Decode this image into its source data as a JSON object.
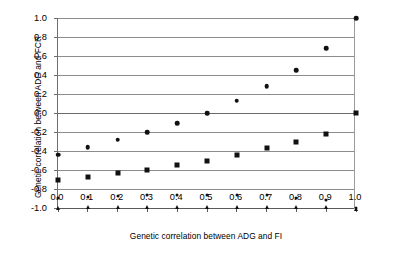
{
  "chart_data": {
    "type": "scatter",
    "title": "",
    "xlabel": "Genetic correlation between ADG and FI",
    "ylabel": "Genetic correlation between ADG and FCR",
    "xlim": [
      0.0,
      1.0
    ],
    "ylim": [
      -1.0,
      1.0
    ],
    "grid": true,
    "legend": "none",
    "xticklabels": [
      "0.0",
      "0.1",
      "0.2",
      "0.3",
      "0.4",
      "0.5",
      "0.6",
      "0.7",
      "0.8",
      "0.9",
      "1.0"
    ],
    "yticklabels": [
      "1.0",
      "0.8",
      "0.6",
      "0.4",
      "0.2",
      "0.0",
      "-0.2",
      "-0.4",
      "-0.6",
      "-0.8",
      "-1.0"
    ],
    "xticks": [
      0.0,
      0.1,
      0.2,
      0.3,
      0.4,
      0.5,
      0.6,
      0.7,
      0.8,
      0.9,
      1.0
    ],
    "yticks": [
      1.0,
      0.8,
      0.6,
      0.4,
      0.2,
      0.0,
      -0.2,
      -0.4,
      -0.6,
      -0.8,
      -1.0
    ],
    "x": [
      0.0,
      0.1,
      0.2,
      0.3,
      0.4,
      0.5,
      0.6,
      0.7,
      0.8,
      0.9,
      1.0
    ],
    "series": [
      {
        "name": "series-circle-upper",
        "marker": "circle",
        "values": [
          -0.44,
          -0.36,
          -0.28,
          -0.2,
          -0.11,
          0.0,
          0.13,
          0.28,
          0.45,
          0.68,
          1.0
        ]
      },
      {
        "name": "series-square-middle",
        "marker": "square",
        "values": [
          -0.7,
          -0.67,
          -0.63,
          -0.6,
          -0.55,
          -0.5,
          -0.44,
          -0.37,
          -0.31,
          -0.22,
          0.0
        ]
      },
      {
        "name": "series-dot-lower",
        "marker": "dot",
        "values": [
          -0.89,
          -0.88,
          -0.87,
          -0.86,
          -0.86,
          -0.86,
          -0.86,
          -0.86,
          -0.89,
          -0.92,
          -1.0
        ]
      },
      {
        "name": "series-triangle-bottom",
        "marker": "triangle",
        "values": [
          -0.99,
          -0.98,
          -0.98,
          -0.98,
          -0.98,
          -0.98,
          -0.98,
          -0.98,
          -0.98,
          -0.98,
          -1.0
        ]
      }
    ]
  }
}
